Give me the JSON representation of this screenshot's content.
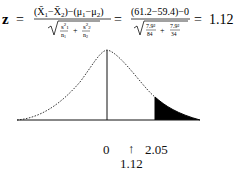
{
  "formula": {
    "lhs": "z",
    "equals": "=",
    "general_numerator": "(X̄₁−X̄₂)−(μ₁−μ₂)",
    "general_denominator": "√(s₁²/n₁ + s₂²/n₂)",
    "numeric_numerator": "(61.2−59.4)−0",
    "numeric_denominator": "√(7.9²/84 + 7.9²/34)",
    "s1_squared": "7.9²",
    "n1": "84",
    "s2_squared": "7.9²",
    "n2": "34",
    "result": "1.12"
  },
  "diagram": {
    "type": "normal-curve",
    "center_label": "0",
    "critical_label": "2.05",
    "arrow_glyph": "↑",
    "test_stat_label": "1.12",
    "shaded_region": "right tail beyond z = 2.05",
    "fill_color": "#000000",
    "line_color": "#111111"
  }
}
